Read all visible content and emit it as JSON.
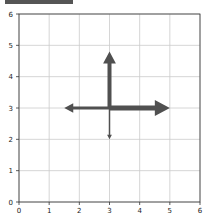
{
  "chart_data": {
    "type": "quiver",
    "title": "",
    "xlabel": "",
    "ylabel": "",
    "xlim": [
      0,
      6
    ],
    "ylim": [
      0,
      6
    ],
    "xticks": [
      "0",
      "1",
      "2",
      "3",
      "4",
      "5",
      "6"
    ],
    "yticks": [
      "0",
      "1",
      "2",
      "3",
      "4",
      "5",
      "6"
    ],
    "grid": true,
    "arrow_color": "#505050",
    "arrows": [
      {
        "name": "up",
        "x0": 3,
        "y0": 3,
        "x1": 3,
        "y1": 4.8,
        "width": 4
      },
      {
        "name": "right",
        "x0": 3,
        "y0": 3,
        "x1": 5,
        "y1": 3,
        "width": 5
      },
      {
        "name": "left",
        "x0": 3,
        "y0": 3,
        "x1": 1.5,
        "y1": 3,
        "width": 3
      },
      {
        "name": "down",
        "x0": 3,
        "y0": 3,
        "x1": 3,
        "y1": 2,
        "width": 1.5
      }
    ]
  }
}
